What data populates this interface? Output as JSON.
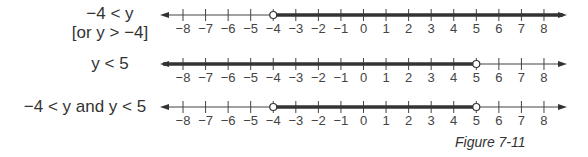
{
  "rows": [
    {
      "label_line1": "−4 < y",
      "label_line2": "[or y > −4]",
      "inequality": "-4 < y",
      "open_points": [
        -4
      ],
      "shaded_from": -4,
      "shaded_to": "+inf"
    },
    {
      "label_line1": "y < 5",
      "inequality": "y < 5",
      "open_points": [
        5
      ],
      "shaded_from": "-inf",
      "shaded_to": 5
    },
    {
      "label_line1": "−4 < y and y < 5",
      "inequality": "-4 < y and y < 5",
      "open_points": [
        -4,
        5
      ],
      "shaded_from": -4,
      "shaded_to": 5
    }
  ],
  "axis": {
    "ticks": [
      "−8",
      "−7",
      "−6",
      "−5",
      "−4",
      "−3",
      "−2",
      "−1",
      "0",
      "1",
      "2",
      "3",
      "4",
      "5",
      "6",
      "7",
      "8"
    ]
  },
  "caption": "Figure 7-11"
}
